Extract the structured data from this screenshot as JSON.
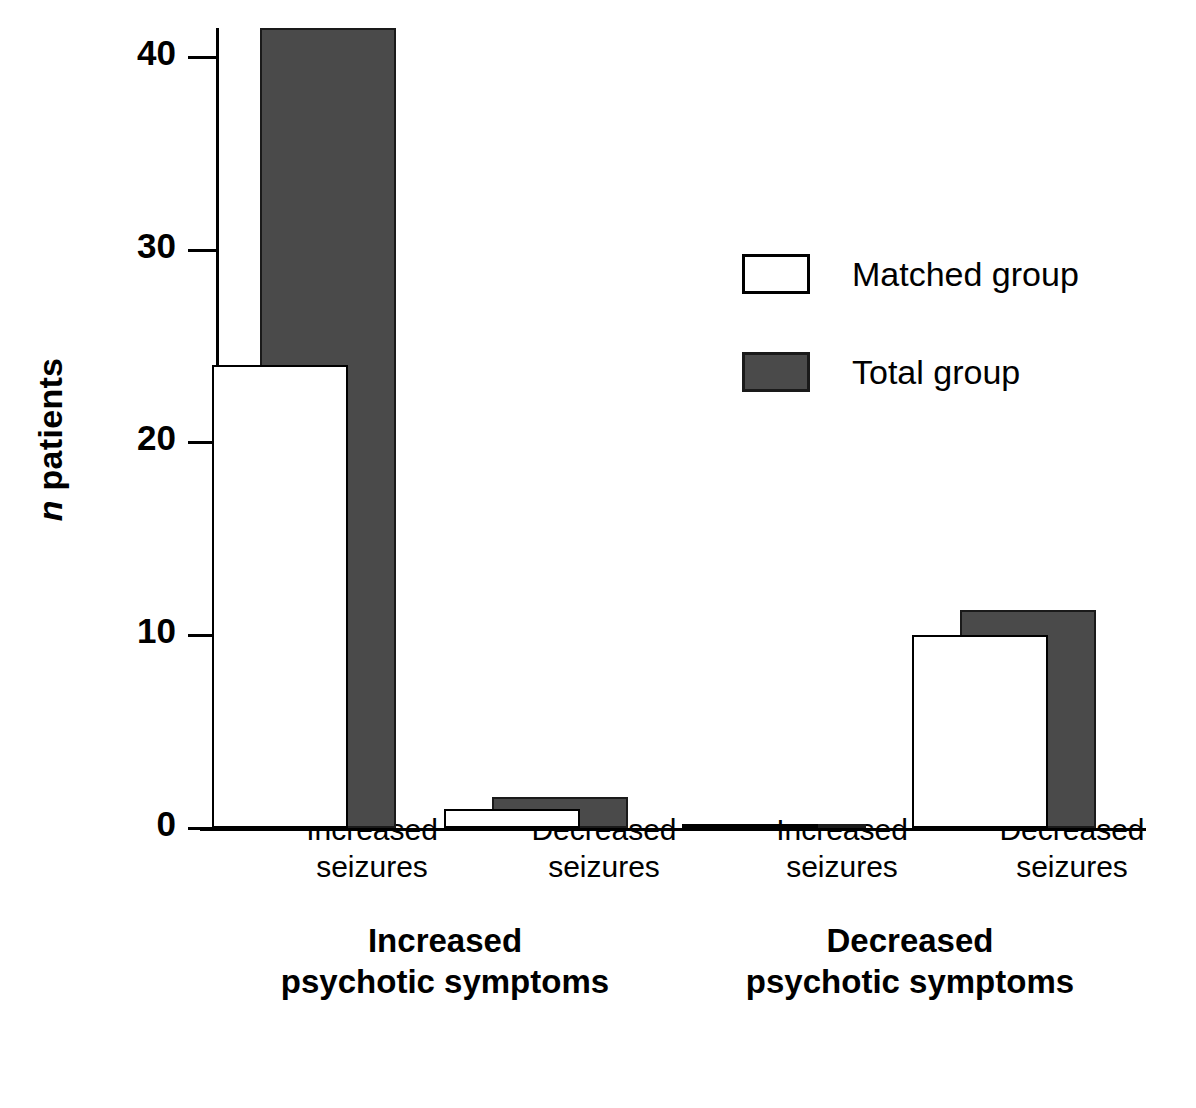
{
  "chart_data": {
    "type": "bar",
    "title": "",
    "xlabel": "",
    "ylabel": "n patients",
    "ylim": [
      0,
      41.5
    ],
    "yticks": [
      0,
      10,
      20,
      30,
      40
    ],
    "ytick_labels": [
      "0",
      "10",
      "20",
      "30",
      "40"
    ],
    "grid": false,
    "legend_position": "upper-center-right",
    "categories": [
      "Increased\nseizures",
      "Decreased\nseizures",
      "Increased\nseizures",
      "Decreased\nseizures"
    ],
    "group_labels": [
      "Increased\npsychotic symptoms",
      "Decreased\npsychotic symptoms"
    ],
    "series": [
      {
        "name": "Matched group",
        "color": "#ffffff",
        "values": [
          24,
          1,
          0.2,
          10
        ]
      },
      {
        "name": "Total group",
        "color": "#4a4a4a",
        "values": [
          41.5,
          1.6,
          0.2,
          11.3
        ]
      }
    ]
  },
  "axis": {
    "y_label_italic_part": "n",
    "y_label_rest": " patients"
  },
  "legend": {
    "items": [
      {
        "label": "Matched group"
      },
      {
        "label": "Total group"
      }
    ]
  }
}
